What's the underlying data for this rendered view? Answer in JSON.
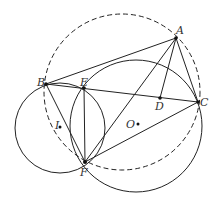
{
  "diagram": {
    "type": "geometry",
    "points": {
      "A": {
        "label": "A",
        "x": 176,
        "y": 38
      },
      "B": {
        "label": "B",
        "x": 46,
        "y": 84
      },
      "C": {
        "label": "C",
        "x": 198,
        "y": 102
      },
      "D": {
        "label": "D",
        "x": 160,
        "y": 98
      },
      "E": {
        "label": "E",
        "x": 84,
        "y": 88
      },
      "F": {
        "label": "F",
        "x": 85,
        "y": 162
      },
      "O": {
        "label": "O",
        "x": 138,
        "y": 124
      },
      "I": {
        "label": "I",
        "x": 60,
        "y": 127
      }
    },
    "segments": [
      "AB",
      "AC",
      "AD",
      "AF",
      "BC",
      "BF",
      "EF",
      "CF"
    ],
    "circles": [
      {
        "name": "circumcircle ABC",
        "style": "dashed",
        "through": [
          "A",
          "B",
          "C",
          "F"
        ]
      },
      {
        "name": "circle I",
        "style": "solid",
        "center": "I",
        "through": [
          "B",
          "E",
          "F"
        ]
      },
      {
        "name": "circle O",
        "style": "solid",
        "center": "O",
        "through": [
          "E",
          "F",
          "C"
        ]
      }
    ],
    "stroke_color": "#222222"
  }
}
